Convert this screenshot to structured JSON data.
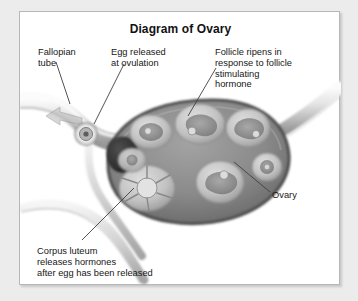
{
  "figure": {
    "title": "Diagram of Ovary",
    "background_color": "#ececed",
    "panel_color": "#ffffff",
    "border_color": "#b7b7b7",
    "text_color": "#171717",
    "title_color": "#121212"
  },
  "labels": {
    "fallopian_tube": "Fallopian\ntube",
    "egg_released": "Egg released\nat ovulation",
    "follicle_ripens": "Follicle ripens in\nresponse to follicle\nstimulating\nhormone",
    "ovary": "Ovary",
    "corpus_luteum": "Corpus luteum\nreleases hormones\nafter egg has been released"
  },
  "diagram_data": {
    "type": "anatomical-illustration",
    "subject": "ovary cross-section",
    "style": "grayscale airbrush medical illustration",
    "palette": {
      "stroma": "#8d8d8d",
      "stroma_dark": "#6f6f6f",
      "cortex_rim": "#5a5a5a",
      "follicle_granulosa": "#c9c9c9",
      "follicle_antrum": "#9a9a9a",
      "oocyte": "#d8d8d8",
      "released_egg_mass": "#3a3a3a",
      "tube_light": "#f2f2f2",
      "tube_mid": "#cfcfcf",
      "tube_shadow": "#9c9c9c",
      "leader_line": "#4a4a4a"
    },
    "structures": [
      {
        "name": "fallopian-tube",
        "position": "upper-left, sweeping diagonally down-right toward ovary"
      },
      {
        "name": "egg-in-tube",
        "position": "left of ovary, small ringed circle inside tube"
      },
      {
        "name": "flow-arrow",
        "position": "inside fallopian tube, pointing up-left",
        "meaning": "egg travel direction"
      },
      {
        "name": "released-egg-mass",
        "position": "left edge of ovary, dark rounded mass at ovulation site"
      },
      {
        "name": "ovary-body",
        "position": "center, large ovoid stroma mass"
      },
      {
        "name": "suspensory-ligament",
        "position": "upper-right, tapering band leaving ovary"
      },
      {
        "name": "broad-ligament",
        "position": "lower-left, curving bands beneath ovary"
      }
    ],
    "follicles": [
      {
        "id": 1,
        "stage": "primary follicle",
        "cx": 120,
        "cy": 112,
        "r": 20
      },
      {
        "id": 2,
        "stage": "secondary follicle",
        "cx": 178,
        "cy": 101,
        "r": 24
      },
      {
        "id": 3,
        "stage": "graafian follicle",
        "cx": 225,
        "cy": 110,
        "r": 20
      },
      {
        "id": 4,
        "stage": "mature follicle",
        "cx": 243,
        "cy": 148,
        "r": 15
      },
      {
        "id": 5,
        "stage": "ruptured follicle",
        "cx": 196,
        "cy": 163,
        "r": 22
      },
      {
        "id": 6,
        "stage": "corpus luteum",
        "cx": 118,
        "cy": 168,
        "r": 26
      },
      {
        "id": 7,
        "stage": "regressing follicle",
        "cx": 58,
        "cy": 162,
        "r": 16
      }
    ],
    "leader_lines": [
      {
        "label": "fallopian_tube",
        "from": [
          36,
          60
        ],
        "to": [
          50,
          96
        ]
      },
      {
        "label": "egg_released",
        "from": [
          104,
          62
        ],
        "to": [
          72,
          112
        ]
      },
      {
        "label": "follicle_ripens",
        "from": [
          196,
          66
        ],
        "to": [
          170,
          106
        ]
      },
      {
        "label": "ovary",
        "from": [
          250,
          184
        ],
        "to": [
          213,
          152
        ]
      },
      {
        "label": "corpus_luteum",
        "from": [
          62,
          231
        ],
        "to": [
          110,
          180
        ]
      }
    ]
  }
}
